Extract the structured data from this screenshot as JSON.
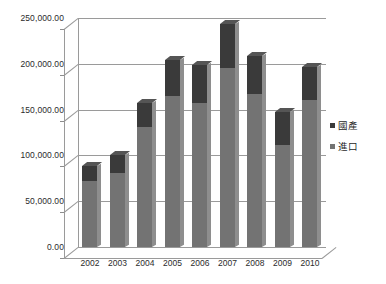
{
  "chart_data": {
    "type": "bar",
    "subtype": "stacked-column-3d",
    "title": "",
    "xlabel": "",
    "ylabel": "",
    "categories": [
      "2002",
      "2003",
      "2004",
      "2005",
      "2006",
      "2007",
      "2008",
      "2009",
      "2010"
    ],
    "series": [
      {
        "name": "進口",
        "color": "#737373",
        "values": [
          72000,
          81000,
          131000,
          165000,
          157000,
          195000,
          167000,
          111000,
          161000
        ]
      },
      {
        "name": "國產",
        "color": "#3a3a3a",
        "values": [
          16000,
          19000,
          26000,
          39000,
          42000,
          48000,
          42000,
          36000,
          36000
        ]
      }
    ],
    "totals": [
      88000,
      100000,
      157000,
      204000,
      199000,
      243000,
      209000,
      147000,
      197000
    ],
    "ylim": [
      0,
      250000
    ],
    "ytick_values": [
      0,
      50000,
      100000,
      150000,
      200000,
      250000
    ],
    "ytick_labels": [
      "0.00",
      "50,000.00",
      "100,000.00",
      "150,000.00",
      "200,000.00",
      "250,000.00"
    ],
    "grid": true,
    "legend_position": "right",
    "legend": [
      "國產",
      "進口"
    ]
  },
  "legend": {
    "items": [
      {
        "label": "國產",
        "color": "#3a3a3a"
      },
      {
        "label": "進口",
        "color": "#737373"
      }
    ]
  },
  "colors": {
    "series_domestic": "#3a3a3a",
    "series_import": "#737373",
    "gridline": "#9a9a9a",
    "text": "#2b2b2b",
    "background": "#ffffff"
  }
}
